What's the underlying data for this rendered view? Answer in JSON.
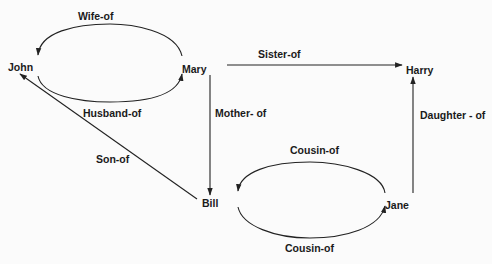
{
  "diagram": {
    "type": "semantic-network",
    "nodes": [
      {
        "id": "john",
        "label": "John"
      },
      {
        "id": "mary",
        "label": "Mary"
      },
      {
        "id": "harry",
        "label": "Harry"
      },
      {
        "id": "bill",
        "label": "Bill"
      },
      {
        "id": "jane",
        "label": "Jane"
      }
    ],
    "edges": [
      {
        "id": "wife-of",
        "from": "mary",
        "to": "john",
        "label": "Wife-of"
      },
      {
        "id": "husband-of",
        "from": "john",
        "to": "mary",
        "label": "Husband-of"
      },
      {
        "id": "sister-of",
        "from": "mary",
        "to": "harry",
        "label": "Sister-of"
      },
      {
        "id": "mother-of",
        "from": "mary",
        "to": "bill",
        "label": "Mother- of"
      },
      {
        "id": "son-of",
        "from": "bill",
        "to": "john",
        "label": "Son-of"
      },
      {
        "id": "daughter-of",
        "from": "jane",
        "to": "harry",
        "label": "Daughter - of"
      },
      {
        "id": "cousin-of-top",
        "from": "jane",
        "to": "bill",
        "label": "Cousin-of"
      },
      {
        "id": "cousin-of-bottom",
        "from": "bill",
        "to": "jane",
        "label": "Cousin-of"
      }
    ]
  },
  "colors": {
    "background": "#fbfbfb",
    "ink": "#1a1a1a"
  }
}
